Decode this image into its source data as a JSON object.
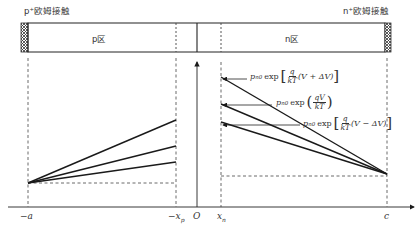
{
  "contacts": {
    "left_label": "p⁺欧姆接触",
    "right_label": "n⁺欧姆接触"
  },
  "regions": {
    "p_region": "p区",
    "n_region": "n区"
  },
  "axis": {
    "ticks": [
      "−a",
      "−x",
      "O",
      "x",
      "c"
    ],
    "tick_subscripts": {
      "neg_xp": "p",
      "xn": "n"
    }
  },
  "equations": [
    {
      "id": "plus",
      "prefix": "p",
      "sub": "n0",
      "fn": "exp",
      "num": "q",
      "den": "kT",
      "arg": "(V + ΔV)",
      "open": "[",
      "close": "]"
    },
    {
      "id": "zero",
      "prefix": "p",
      "sub": "n0",
      "fn": "exp",
      "num": "qV",
      "den": "kT",
      "arg": "",
      "open": "(",
      "close": ")"
    },
    {
      "id": "minus",
      "prefix": "p",
      "sub": "n0",
      "fn": "exp",
      "num": "q",
      "den": "kT",
      "arg": "(V − ΔV)",
      "open": "[",
      "close": "]"
    }
  ],
  "colors": {
    "line": "#1a1a1a",
    "dashed": "#444444",
    "hatch": "#333333"
  }
}
